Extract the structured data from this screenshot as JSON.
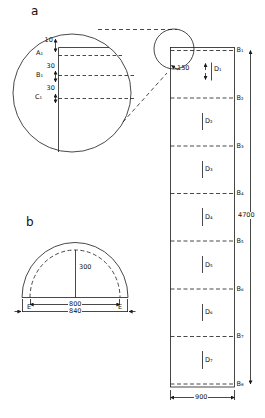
{
  "panel_a": {
    "label": "a",
    "magnifier": {
      "dim_top": "10",
      "line_a": "A₁",
      "gap_ab": "30",
      "line_b": "B₁",
      "gap_bc": "30",
      "line_c": "C₁"
    }
  },
  "column": {
    "dim_segment": "150",
    "d_labels": [
      "D₁",
      "D₂",
      "D₃",
      "D₄",
      "D₅",
      "D₆",
      "D₇"
    ],
    "b_labels": [
      "B₁",
      "B₂",
      "B₃",
      "B₄",
      "B₅",
      "B₆",
      "B₇",
      "B₈"
    ],
    "dim_length": "4700",
    "dim_width": "900"
  },
  "panel_b": {
    "label": "b",
    "dim_height": "300",
    "dim_inner": "800",
    "dim_outer": "840",
    "edge_left": "E",
    "edge_right": "E"
  },
  "colors": {
    "line": "#1a1a1a",
    "background": "#ffffff"
  }
}
